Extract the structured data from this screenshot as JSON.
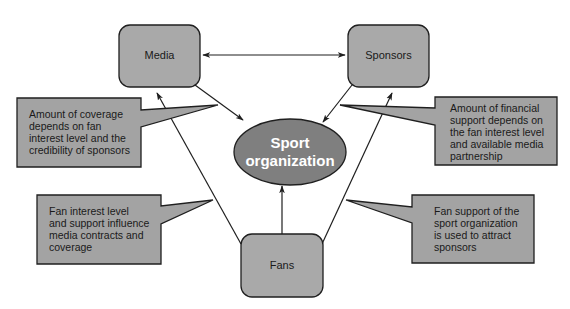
{
  "colors": {
    "box_fill": "#a9a9a9",
    "ellipse_fill": "#7f7f7f",
    "callout_fill": "#a3a3a3",
    "stroke": "#1f1f1f",
    "center_text": "#ffffff"
  },
  "nodes": {
    "media": {
      "label": "Media"
    },
    "sponsors": {
      "label": "Sponsors"
    },
    "fans": {
      "label": "Fans"
    },
    "center": {
      "line1": "Sport",
      "line2": "organization"
    }
  },
  "callouts": {
    "media_coverage": {
      "lines": [
        "Amount of coverage",
        "depends on fan",
        "interest level and the",
        "credibility of sponsors"
      ]
    },
    "financial_support": {
      "lines": [
        "Amount of financial",
        "support depends on",
        "the fan interest level",
        "and available media",
        "partnership"
      ]
    },
    "fan_influence": {
      "lines": [
        "Fan interest level",
        "and support influence",
        "media contracts and",
        "coverage"
      ]
    },
    "fan_support": {
      "lines": [
        "Fan support of the",
        "sport organization",
        "is used to attract",
        "sponsors"
      ]
    }
  },
  "edges": [
    {
      "from": "Media",
      "to": "Sponsors",
      "type": "bidirectional"
    },
    {
      "from": "Media",
      "to": "Sport organization",
      "type": "directed"
    },
    {
      "from": "Sponsors",
      "to": "Sport organization",
      "type": "directed"
    },
    {
      "from": "Fans",
      "to": "Sport organization",
      "type": "directed"
    },
    {
      "from": "Fans",
      "to": "Media",
      "type": "directed"
    },
    {
      "from": "Fans",
      "to": "Sponsors",
      "type": "directed"
    }
  ]
}
